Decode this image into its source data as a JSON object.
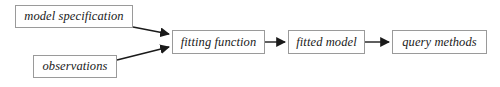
{
  "diagram": {
    "type": "flowchart",
    "orientation": "left-to-right",
    "background_color": "#ffffff",
    "box_border_color": "#9a9a9a",
    "arrow_color": "#1a1a1a",
    "text_color": "#1a1a1a",
    "nodes": [
      {
        "id": "model-specification",
        "label": "model specification"
      },
      {
        "id": "observations",
        "label": "observations"
      },
      {
        "id": "fitting-function",
        "label": "fitting function"
      },
      {
        "id": "fitted-model",
        "label": "fitted model"
      },
      {
        "id": "query-methods",
        "label": "query methods"
      }
    ],
    "edges": [
      {
        "id": "edge-model-specification-to-fitting-function",
        "from": "model-specification",
        "to": "fitting-function",
        "style": "diagonal-arrow"
      },
      {
        "id": "edge-observations-to-fitting-function",
        "from": "observations",
        "to": "fitting-function",
        "style": "diagonal-arrow"
      },
      {
        "id": "edge-fitting-function-to-fitted-model",
        "from": "fitting-function",
        "to": "fitted-model",
        "style": "horizontal-arrow"
      },
      {
        "id": "edge-fitted-model-to-query-methods",
        "from": "fitted-model",
        "to": "query-methods",
        "style": "horizontal-arrow"
      }
    ]
  }
}
